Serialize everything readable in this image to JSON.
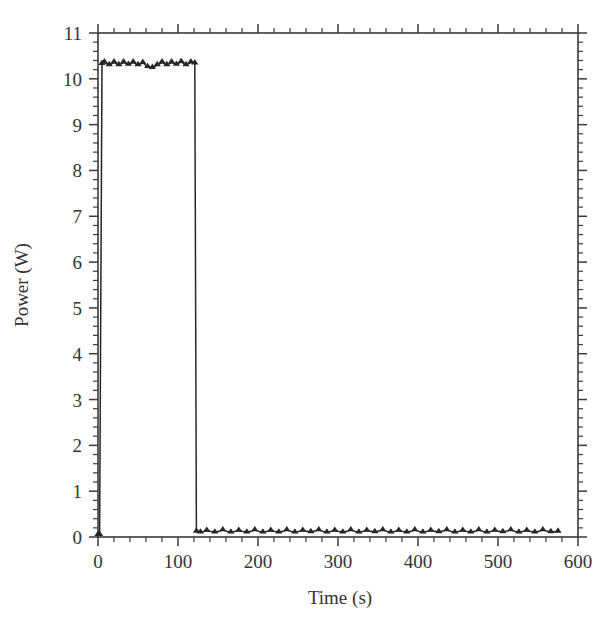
{
  "chart_data": {
    "type": "line",
    "title": "",
    "xlabel": "Time (s)",
    "ylabel": "Power (W)",
    "xlim": [
      0,
      600
    ],
    "ylim": [
      0,
      11
    ],
    "xticks": [
      0,
      100,
      200,
      300,
      400,
      500,
      600
    ],
    "xtick_labels": [
      "0",
      "100",
      "200",
      "300",
      "400",
      "500",
      "600"
    ],
    "yticks": [
      0,
      1,
      2,
      3,
      4,
      5,
      6,
      7,
      8,
      9,
      10,
      11
    ],
    "ytick_labels": [
      "0",
      "1",
      "2",
      "3",
      "4",
      "5",
      "6",
      "7",
      "8",
      "9",
      "10",
      "11"
    ],
    "x_minor_per_major": 5,
    "y_minor_per_major": 5,
    "grid": false,
    "legend": null,
    "frame": "box",
    "tick_direction": "out",
    "line_color": "#262626",
    "marker": "triangle-up",
    "series": [
      {
        "name": "Power",
        "description": "Step pulse: near 0 W before t=5 s, plateau near 10.3 W from t=5 s to t=121 s, then drops back to about 0.1 W and stays there until t=575 s.",
        "x": [
          0,
          2,
          5,
          8,
          14,
          20,
          26,
          32,
          38,
          44,
          50,
          56,
          62,
          68,
          74,
          80,
          86,
          92,
          98,
          104,
          110,
          116,
          121,
          123,
          128,
          136,
          146,
          156,
          166,
          176,
          186,
          196,
          206,
          216,
          226,
          236,
          246,
          256,
          266,
          276,
          286,
          296,
          306,
          316,
          326,
          336,
          346,
          356,
          366,
          376,
          386,
          396,
          406,
          416,
          426,
          436,
          446,
          456,
          466,
          476,
          486,
          496,
          506,
          516,
          526,
          536,
          546,
          556,
          566,
          575
        ],
        "y": [
          0.05,
          0.05,
          10.33,
          10.36,
          10.3,
          10.36,
          10.3,
          10.36,
          10.31,
          10.36,
          10.3,
          10.35,
          10.26,
          10.24,
          10.3,
          10.36,
          10.3,
          10.36,
          10.31,
          10.37,
          10.3,
          10.36,
          10.34,
          0.12,
          0.1,
          0.14,
          0.1,
          0.15,
          0.1,
          0.14,
          0.1,
          0.15,
          0.1,
          0.14,
          0.1,
          0.15,
          0.1,
          0.14,
          0.11,
          0.15,
          0.1,
          0.14,
          0.1,
          0.15,
          0.1,
          0.14,
          0.11,
          0.15,
          0.1,
          0.14,
          0.1,
          0.15,
          0.1,
          0.14,
          0.11,
          0.15,
          0.1,
          0.14,
          0.1,
          0.15,
          0.1,
          0.14,
          0.11,
          0.15,
          0.1,
          0.14,
          0.1,
          0.15,
          0.11,
          0.12
        ]
      }
    ],
    "annotations": {
      "plateau_value_w": 10.33,
      "baseline_value_w": 0.12,
      "pulse_start_s": 5,
      "pulse_end_s": 121,
      "data_end_s": 575
    }
  }
}
